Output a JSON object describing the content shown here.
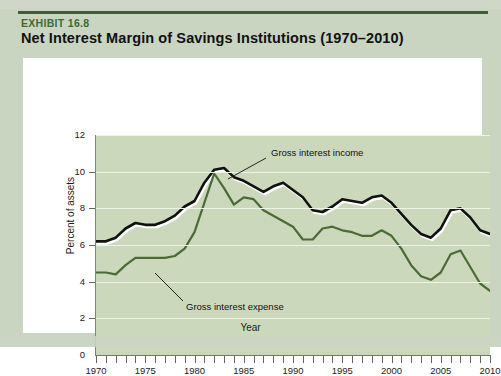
{
  "exhibit": {
    "label": "EXHIBIT 16.8",
    "title": "Net Interest Margin of Savings Institutions (1970–2010)",
    "label_color": "#3d6b33",
    "rule_color": "#3f5c34",
    "page_background": "#c9d4c1",
    "card_background": "#ffffff"
  },
  "chart_data": {
    "type": "line",
    "title": "Net Interest Margin of Savings Institutions (1970–2010)",
    "xlabel": "Year",
    "ylabel": "Percent of assets",
    "xlim": [
      1970,
      2010
    ],
    "ylim": [
      0,
      12
    ],
    "ytick_values": [
      0,
      2,
      4,
      6,
      8,
      10,
      12
    ],
    "ytick_labels": [
      "0",
      "2",
      "4",
      "6",
      "8",
      "10",
      "12"
    ],
    "xtick_labels": [
      "1970",
      "1975",
      "1980",
      "1985",
      "1990",
      "1995",
      "2000",
      "2005",
      "2010"
    ],
    "xtick_values": [
      1970,
      1975,
      1980,
      1985,
      1990,
      1995,
      2000,
      2005,
      2010
    ],
    "minor_xticks_every": 1,
    "grid": "horizontal",
    "grid_color": "#eef3e8",
    "plot_background": "#ccd8bb",
    "legend_position": "inline-annotations",
    "x": [
      1970,
      1971,
      1972,
      1973,
      1974,
      1975,
      1976,
      1977,
      1978,
      1979,
      1980,
      1981,
      1982,
      1983,
      1984,
      1985,
      1986,
      1987,
      1988,
      1989,
      1990,
      1991,
      1992,
      1993,
      1994,
      1995,
      1996,
      1997,
      1998,
      1999,
      2000,
      2001,
      2002,
      2003,
      2004,
      2005,
      2006,
      2007,
      2008,
      2009,
      2010
    ],
    "series": [
      {
        "name": "Gross interest income",
        "color": "#111111",
        "line_width": 2.6,
        "shadow_color": "#ffffff",
        "values": [
          6.2,
          6.2,
          6.4,
          6.9,
          7.2,
          7.1,
          7.1,
          7.3,
          7.6,
          8.1,
          8.4,
          9.4,
          10.1,
          10.2,
          9.7,
          9.5,
          9.2,
          8.9,
          9.2,
          9.4,
          9.0,
          8.6,
          7.9,
          7.8,
          8.1,
          8.5,
          8.4,
          8.3,
          8.6,
          8.7,
          8.3,
          7.7,
          7.1,
          6.6,
          6.4,
          6.9,
          7.9,
          8.0,
          7.5,
          6.8,
          6.6
        ]
      },
      {
        "name": "Gross interest expense",
        "color": "#4a6b35",
        "line_width": 2.2,
        "values": [
          4.5,
          4.5,
          4.4,
          4.9,
          5.3,
          5.3,
          5.3,
          5.3,
          5.4,
          5.8,
          6.7,
          8.3,
          9.9,
          9.1,
          8.2,
          8.6,
          8.5,
          7.9,
          7.6,
          7.3,
          7.0,
          6.3,
          6.3,
          6.9,
          7.0,
          6.8,
          6.7,
          6.5,
          6.5,
          6.8,
          6.5,
          5.8,
          4.9,
          4.3,
          4.1,
          4.5,
          5.5,
          5.7,
          4.8,
          3.9,
          3.5
        ]
      }
    ],
    "annotations": [
      {
        "text": "Gross interest income",
        "series": "Gross interest income",
        "label_x_px": 248,
        "label_y_px": 89,
        "leader_from_px": [
          243,
          100
        ],
        "leader_to_px": [
          205,
          121
        ]
      },
      {
        "text": "Gross interest expense",
        "series": "Gross interest expense",
        "label_x_px": 163,
        "label_y_px": 243,
        "leader_from_px": [
          160,
          243
        ],
        "leader_to_px": [
          132,
          215
        ]
      }
    ]
  }
}
